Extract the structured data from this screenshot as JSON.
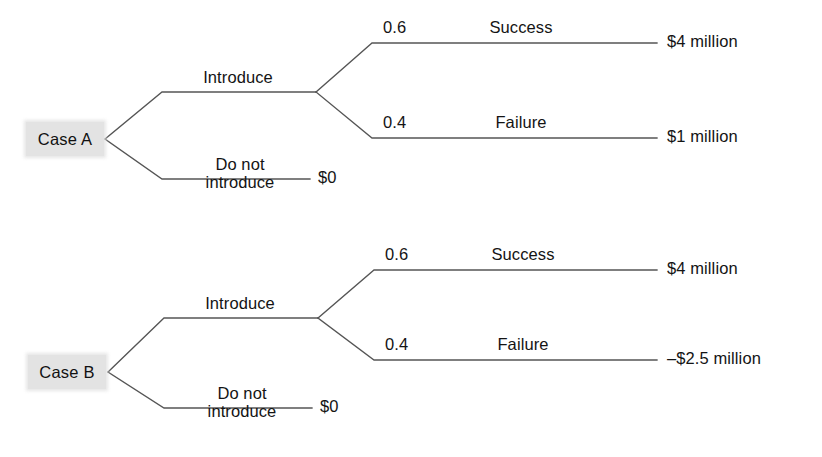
{
  "diagram": {
    "type": "decision-tree",
    "line_color": "#555555",
    "label_box_color": "#e3e3e3",
    "text_color": "#141414",
    "trees": [
      {
        "id": "case-a",
        "root_label": "Case A",
        "decision_branches": [
          {
            "id": "introduce",
            "label": "Introduce",
            "chance_branches": [
              {
                "id": "success",
                "probability": "0.6",
                "label": "Success",
                "payoff": "$4 million"
              },
              {
                "id": "failure",
                "probability": "0.4",
                "label": "Failure",
                "payoff": "$1 million"
              }
            ]
          },
          {
            "id": "do-not-introduce",
            "label_line1": "Do not",
            "label_line2": "introduce",
            "payoff": "$0"
          }
        ]
      },
      {
        "id": "case-b",
        "root_label": "Case B",
        "decision_branches": [
          {
            "id": "introduce",
            "label": "Introduce",
            "chance_branches": [
              {
                "id": "success",
                "probability": "0.6",
                "label": "Success",
                "payoff": "$4 million"
              },
              {
                "id": "failure",
                "probability": "0.4",
                "label": "Failure",
                "payoff": "–$2.5 million"
              }
            ]
          },
          {
            "id": "do-not-introduce",
            "label_line1": "Do not",
            "label_line2": "introduce",
            "payoff": "$0"
          }
        ]
      }
    ]
  }
}
